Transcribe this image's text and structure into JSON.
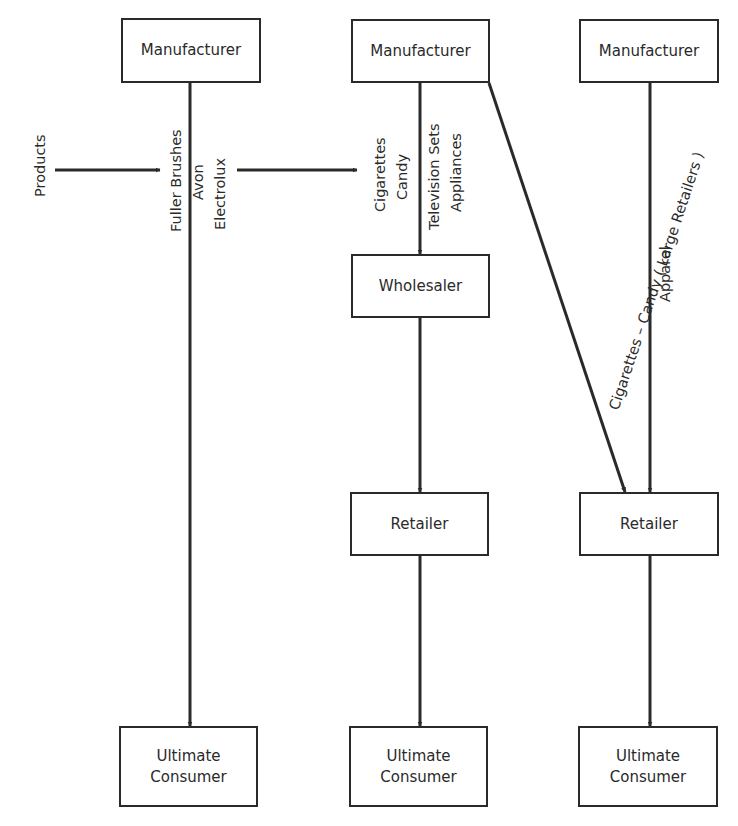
{
  "diagram": {
    "type": "distribution-channels-flowchart",
    "colors": {
      "line": "#2a2a2a",
      "background": "#ffffff"
    },
    "channels": [
      {
        "id": "channel-1",
        "nodes": [
          {
            "id": "mfr1",
            "label": "Manufacturer"
          },
          {
            "id": "uc1",
            "label": "Ultimate\nConsumer"
          }
        ],
        "edges": [
          {
            "from": "mfr1",
            "to": "uc1",
            "labels": [
              "Fuller Brushes",
              "Avon",
              "Electrolux"
            ]
          }
        ]
      },
      {
        "id": "channel-2",
        "nodes": [
          {
            "id": "mfr2",
            "label": "Manufacturer"
          },
          {
            "id": "wh",
            "label": "Wholesaler"
          },
          {
            "id": "ret2",
            "label": "Retailer"
          },
          {
            "id": "uc2",
            "label": "Ultimate\nConsumer"
          }
        ],
        "edges": [
          {
            "from": "mfr2",
            "to": "wh",
            "labels": [
              "Cigarettes",
              "Candy",
              "Television Sets",
              "Appliances"
            ]
          },
          {
            "from": "wh",
            "to": "ret2",
            "labels": []
          },
          {
            "from": "ret2",
            "to": "uc2",
            "labels": []
          },
          {
            "from": "mfr2",
            "to": "ret3",
            "labels": [
              "Cigarettes – Candy  ( Large Retailers )"
            ]
          }
        ]
      },
      {
        "id": "channel-3",
        "nodes": [
          {
            "id": "mfr3",
            "label": "Manufacturer"
          },
          {
            "id": "ret3",
            "label": "Retailer"
          },
          {
            "id": "uc3",
            "label": "Ultimate\nConsumer"
          }
        ],
        "edges": [
          {
            "from": "mfr3",
            "to": "ret3",
            "labels": [
              "Apparel"
            ]
          },
          {
            "from": "ret3",
            "to": "uc3",
            "labels": []
          }
        ]
      }
    ]
  },
  "boxes": {
    "mfr1": "Manufacturer",
    "mfr2": "Manufacturer",
    "mfr3": "Manufacturer",
    "wholesaler": "Wholesaler",
    "retailer2": "Retailer",
    "retailer3": "Retailer",
    "consumer1": "Ultimate\nConsumer",
    "consumer2": "Ultimate\nConsumer",
    "consumer3": "Ultimate\nConsumer"
  },
  "labels": {
    "products": "Products",
    "fuller_brushes": "Fuller Brushes",
    "avon": "Avon",
    "electrolux": "Electrolux",
    "cigarettes": "Cigarettes",
    "candy": "Candy",
    "television_sets": "Television Sets",
    "appliances": "Appliances",
    "large_retailers": "Cigarettes – Candy  ( Large Retailers )",
    "apparel": "Apparel"
  }
}
